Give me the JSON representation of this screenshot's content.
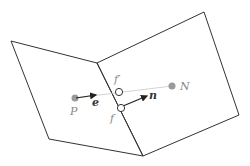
{
  "diagram": {
    "colors": {
      "edge": "#333333",
      "point_fill": "#9a9a9a",
      "connector": "#c8c8c8",
      "label_gray": "#888888",
      "vector": "#222222"
    },
    "labels": {
      "P": "P",
      "N": "N",
      "e": "e",
      "n": "n",
      "f": "f",
      "f_prime": "f′"
    },
    "nodes": [
      {
        "id": "P",
        "label": "P",
        "type": "cell-center",
        "x": 75,
        "y": 98
      },
      {
        "id": "N",
        "label": "N",
        "type": "cell-center",
        "x": 172,
        "y": 86
      },
      {
        "id": "f_prime",
        "label": "f′",
        "type": "face-point",
        "x": 119,
        "y": 92
      },
      {
        "id": "f",
        "label": "f",
        "type": "face-center",
        "x": 121,
        "y": 108
      }
    ],
    "vectors": [
      {
        "id": "e",
        "label": "e",
        "from": "P",
        "direction": "toward N"
      },
      {
        "id": "n",
        "label": "n",
        "from": "f",
        "direction": "face normal"
      }
    ],
    "cells": [
      {
        "id": "left-cell",
        "vertices": [
          [
            11,
            41
          ],
          [
            97,
            63
          ],
          [
            143,
            156
          ],
          [
            49,
            139
          ]
        ]
      },
      {
        "id": "right-cell",
        "vertices": [
          [
            97,
            63
          ],
          [
            204,
            12
          ],
          [
            239,
            115
          ],
          [
            143,
            156
          ]
        ]
      }
    ]
  }
}
